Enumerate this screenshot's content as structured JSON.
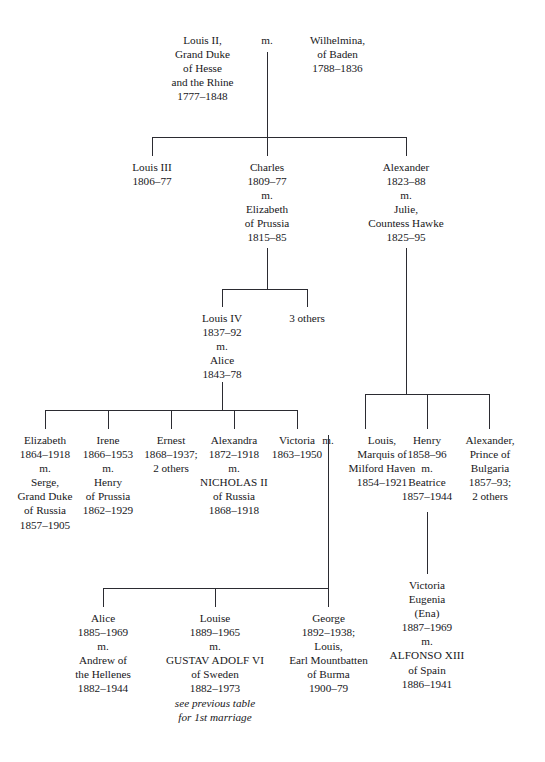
{
  "diagram": {
    "marriage_symbol": "m.",
    "line_color": "#2b2b31",
    "text_color": "#17171a"
  },
  "generation1": {
    "husband": {
      "l1": "Louis II,",
      "l2": "Grand Duke",
      "l3": "of Hesse",
      "l4": "and the Rhine",
      "l5": "1777–1848"
    },
    "marriage": "m.",
    "wife": {
      "l1": "Wilhelmina,",
      "l2": "of Baden",
      "l3": "1788–1836"
    }
  },
  "generation2": {
    "child1": {
      "l1": "Louis III",
      "l2": "1806–77"
    },
    "child2": {
      "l1": "Charles",
      "l2": "1809–77",
      "l3": "m.",
      "l4": "Elizabeth",
      "l5": "of Prussia",
      "l6": "1815–85"
    },
    "child3": {
      "l1": "Alexander",
      "l2": "1823–88",
      "l3": "m.",
      "l4": "Julie,",
      "l5": "Countess Hawke",
      "l6": "1825–95"
    }
  },
  "generation3": {
    "child1": {
      "l1": "Louis IV",
      "l2": "1837–92",
      "l3": "m.",
      "l4": "Alice",
      "l5": "1843–78"
    },
    "child2": {
      "l1": "3 others"
    }
  },
  "generation4_left": {
    "child1": {
      "l1": "Elizabeth",
      "l2": "1864–1918",
      "l3": "m.",
      "l4": "Serge,",
      "l5": "Grand Duke",
      "l6": "of Russia",
      "l7": "1857–1905"
    },
    "child2": {
      "l1": "Irene",
      "l2": "1866–1953",
      "l3": "m.",
      "l4": "Henry",
      "l5": "of Prussia",
      "l6": "1862–1929"
    },
    "child3": {
      "l1": "Ernest",
      "l2": "1868–1937;",
      "l3": "2 others"
    },
    "child4": {
      "l1": "Alexandra",
      "l2": "1872–1918",
      "l3": "m.",
      "l4": "NICHOLAS II",
      "l5": "of Russia",
      "l6": "1868–1918"
    },
    "child5": {
      "l1": "Victoria",
      "l2": "1863–1950"
    },
    "child5_marriage": "m.",
    "child5_spouse": {
      "l1": "Louis,",
      "l2": "Marquis of",
      "l3": "Milford Haven",
      "l4": "1854–1921"
    }
  },
  "generation4_right": {
    "child1": {
      "l1": "Henry",
      "l2": "1858–96",
      "l3": "m.",
      "l4": "Beatrice",
      "l5": "1857–1944"
    },
    "child2": {
      "l1": "Alexander,",
      "l2": "Prince of",
      "l3": "Bulgaria",
      "l4": "1857–93;",
      "l5": "2 others"
    }
  },
  "generation5": {
    "child1": {
      "l1": "Alice",
      "l2": "1885–1969",
      "l3": "m.",
      "l4": "Andrew of",
      "l5": "the Hellenes",
      "l6": "1882–1944"
    },
    "child2": {
      "l1": "Louise",
      "l2": "1889–1965",
      "l3": "m.",
      "l4": "GUSTAV ADOLF VI",
      "l5": "of Sweden",
      "l6": "1882–1973",
      "note1": "see previous table",
      "note2": "for 1st marriage"
    },
    "child3": {
      "l1": "George",
      "l2": "1892–1938;",
      "l3": "Louis,",
      "l4": "Earl Mountbatten",
      "l5": "of Burma",
      "l6": "1900–79"
    },
    "child4": {
      "l1": "Victoria",
      "l2": "Eugenia",
      "l3": "(Ena)",
      "l4": "1887–1969",
      "l5": "m.",
      "l6": "ALFONSO XIII",
      "l7": "of Spain",
      "l8": "1886–1941"
    }
  }
}
